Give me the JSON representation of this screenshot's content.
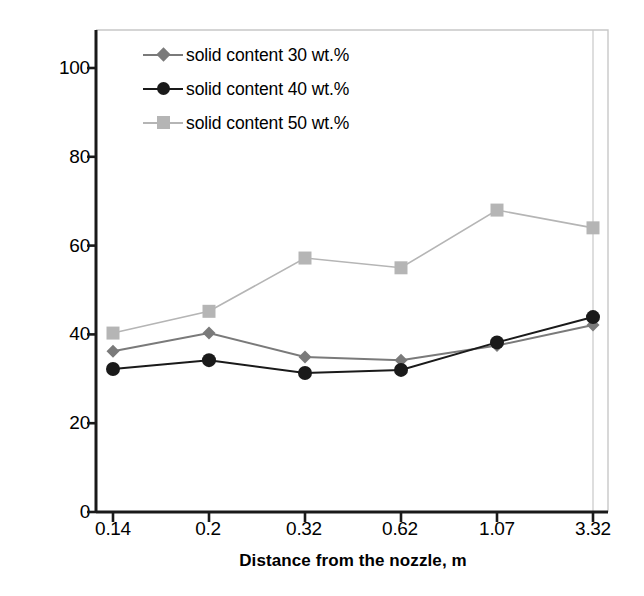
{
  "chart_data": {
    "type": "line",
    "title": "",
    "subtitle": "",
    "xlabel": "Distance from the nozzle, m",
    "ylabel": "Arithmetic mean diameter, µm",
    "categories": [
      "0.14",
      "0.2",
      "0.32",
      "0.62",
      "1.07",
      "3.32"
    ],
    "ylim": [
      0,
      110
    ],
    "yticks": [
      0,
      20,
      40,
      60,
      80,
      100
    ],
    "grid": false,
    "legend_position": "top-left inside",
    "series": [
      {
        "name": "solid content 30 wt.%",
        "marker": "diamond",
        "color": "#7a7a7a",
        "values": [
          36.2,
          40.3,
          34.9,
          34.2,
          37.5,
          42.1
        ]
      },
      {
        "name": "solid content 40 wt.%",
        "marker": "circle",
        "color": "#1a1a1a",
        "values": [
          32.2,
          34.2,
          31.3,
          32.0,
          38.2,
          43.9
        ]
      },
      {
        "name": "solid content 50 wt.%",
        "marker": "square",
        "color": "#b5b5b5",
        "values": [
          40.3,
          45.2,
          57.2,
          55.0,
          68.0,
          64.0
        ]
      }
    ]
  },
  "axes": {
    "y_tick_labels": [
      "0",
      "20",
      "40",
      "60",
      "80",
      "100"
    ],
    "x_tick_labels": [
      "0.14",
      "0.2",
      "0.32",
      "0.62",
      "1.07",
      "3.32"
    ]
  },
  "colors": {
    "axis": "#1a1a1a",
    "plot_border": "#c8c8c8",
    "series_30": "#7a7a7a",
    "series_40": "#1a1a1a",
    "series_50": "#b5b5b5",
    "background": "#ffffff"
  }
}
